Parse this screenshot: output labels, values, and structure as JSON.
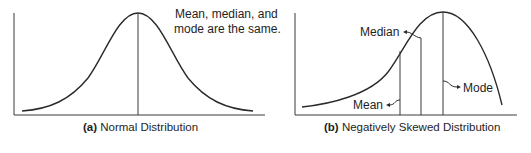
{
  "panels": [
    {
      "id": "a",
      "caption_prefix": "(a)",
      "caption_text": " Normal Distribution",
      "annotation_lines": [
        "Mean, median, and",
        "mode are the same."
      ],
      "distribution": "normal"
    },
    {
      "id": "b",
      "caption_prefix": "(b)",
      "caption_text": " Negatively Skewed Distribution",
      "distribution": "negatively-skewed",
      "markers": [
        {
          "key": "mean",
          "label": "Mean"
        },
        {
          "key": "median",
          "label": "Median"
        },
        {
          "key": "mode",
          "label": "Mode"
        }
      ]
    }
  ]
}
